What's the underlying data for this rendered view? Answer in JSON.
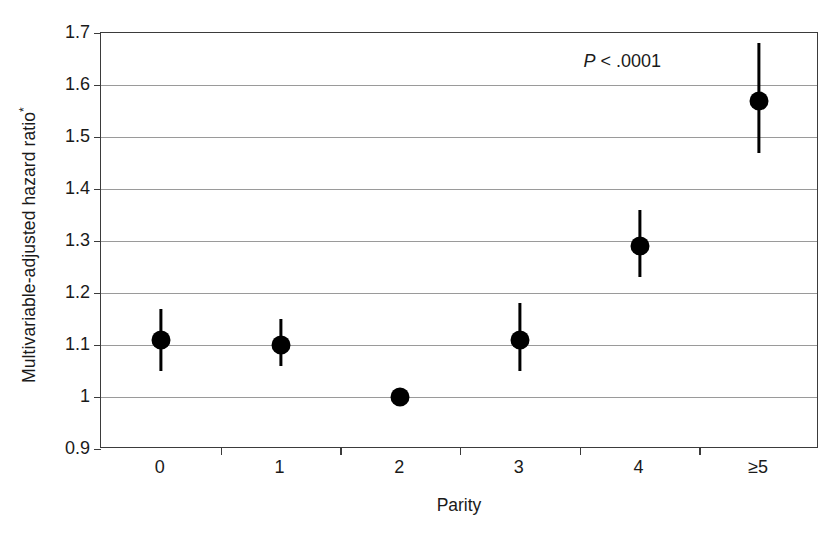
{
  "chart_data": {
    "type": "scatter",
    "title": "",
    "xlabel": "Parity",
    "ylabel": "Multivariable-adjusted hazard ratio*",
    "ylabel_text": "Multivariable-adjusted hazard ratio",
    "ylabel_superscript": "*",
    "categories": [
      "0",
      "1",
      "2",
      "3",
      "4",
      "≥5"
    ],
    "values": [
      1.11,
      1.1,
      1.0,
      1.11,
      1.29,
      1.57
    ],
    "error_low": [
      1.05,
      1.06,
      1.0,
      1.05,
      1.23,
      1.47
    ],
    "error_high": [
      1.17,
      1.15,
      1.0,
      1.18,
      1.36,
      1.68
    ],
    "point_labels": [
      "1.11",
      "1.10",
      "1.00",
      "1.11",
      "1.29",
      "1.57"
    ],
    "ylim": [
      0.9,
      1.7
    ],
    "y_ticks": [
      0.9,
      1.0,
      1.1,
      1.2,
      1.3,
      1.4,
      1.5,
      1.6,
      1.7
    ],
    "y_tick_labels": [
      "0.9",
      "1",
      "1.1",
      "1.2",
      "1.3",
      "1.4",
      "1.5",
      "1.6",
      "1.7"
    ],
    "grid": true,
    "grid_axis": "y",
    "legend": "none",
    "marker_color": "#000000",
    "grid_color": "#9a9a9a",
    "axis_color": "#3b3b3b",
    "background_color": "#ffffff",
    "annotations": [
      {
        "name": "p-value",
        "prefix": "P",
        "text": " < .0001",
        "full_text": "P < .0001",
        "x_category": "4",
        "y_value": 1.645
      }
    ]
  }
}
